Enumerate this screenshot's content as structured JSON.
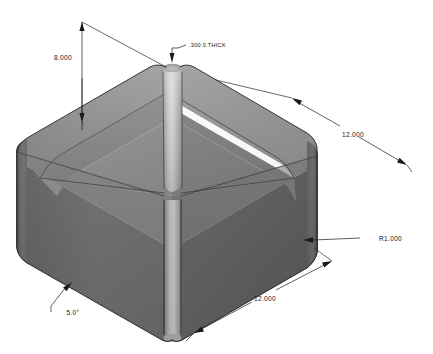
{
  "drawing": {
    "title": "Isometric shaded CAD view of an open-top rounded box",
    "background_color": "#ffffff",
    "line_color": "#1a1a1a",
    "text_color": "#151515"
  },
  "model": {
    "name": "rounded-draft-box",
    "description": "Open-top rectangular tray with filleted corners, drafted side walls and uniform wall thickness",
    "shading": {
      "top_rim_color": "#8e8e8e",
      "inner_wall_left_color": "#7d7d7d",
      "inner_wall_right_color": "#747474",
      "inner_floor_left_color": "#8a8a8a",
      "inner_floor_right_color": "#7a7a7a",
      "outer_wall_left_color": "#6a6a6a",
      "outer_wall_right_color": "#5e5e5e",
      "corner_fillet_highlight_color": "#c9c9c9",
      "corner_fillet_shadow_color": "#909090"
    }
  },
  "dimensions": [
    {
      "id": "height",
      "label": "8.000",
      "value": 8.0,
      "kind": "linear",
      "orientation": "vertical",
      "note": "overall height of box measured on left, leader to top rim"
    },
    {
      "id": "wall-thickness",
      "label": ".300 0.THICK",
      "value": 0.3,
      "kind": "note",
      "orientation": "leader",
      "note": "wall thickness callout with leader to top rim of near corner"
    },
    {
      "id": "depth-right",
      "label": "12.000",
      "value": 12.0,
      "kind": "linear",
      "orientation": "iso-right",
      "note": "overall length along upper right edge"
    },
    {
      "id": "corner-radius",
      "label": "R1.000",
      "value": 1.0,
      "kind": "radius",
      "orientation": "leader",
      "note": "corner fillet radius, leader to lower right vertical corner"
    },
    {
      "id": "width-front",
      "label": "12.000",
      "value": 12.0,
      "kind": "linear",
      "orientation": "iso-front",
      "note": "overall width along lower front edge"
    },
    {
      "id": "draft-angle",
      "label": "5.0°",
      "value": 5.0,
      "kind": "angular",
      "orientation": "leader",
      "note": "draft angle of side walls, leader to lower left outer wall"
    }
  ]
}
